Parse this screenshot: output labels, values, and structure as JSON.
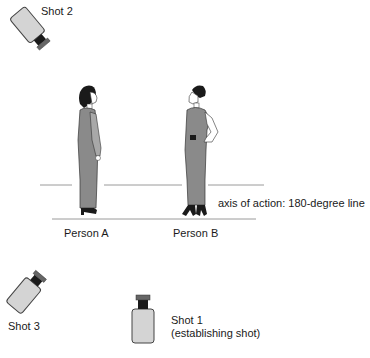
{
  "diagram": {
    "axis_label": "axis of action: 180-degree line",
    "persons": [
      {
        "id": "A",
        "label": "Person A"
      },
      {
        "id": "B",
        "label": "Person B"
      }
    ],
    "shots": [
      {
        "id": "shot2",
        "label": "Shot 2"
      },
      {
        "id": "shot3",
        "label": "Shot 3"
      },
      {
        "id": "shot1",
        "label": "Shot 1",
        "sublabel": "(establishing shot)"
      }
    ],
    "colors": {
      "camera_body": "#d4d4d4",
      "camera_outline": "#444444",
      "lens": "#1a1a1a",
      "dress": "#8a8a8a",
      "line": "#9a9a9a"
    }
  }
}
